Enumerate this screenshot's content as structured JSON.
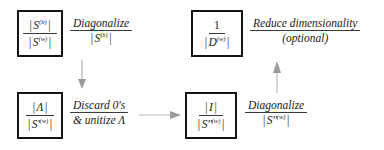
{
  "diagram": {
    "colors": {
      "box_border": "#141414",
      "text": "#1b1b1b",
      "rule": "#3a3a3a",
      "arrow": "#a8a8a8",
      "background": "#ffffff"
    },
    "nodes": [
      {
        "id": "node-sb-sw",
        "numerator": "| S (b) |",
        "num_symbol": "S",
        "num_sup": "(b)",
        "den_symbol": "S",
        "den_sup": "(w)",
        "denominator": "| S (w) |"
      },
      {
        "id": "node-one-dw",
        "numerator": "1",
        "num_symbol": "1",
        "num_sup": "",
        "den_symbol": "D",
        "den_sup": "(w)",
        "denominator": "| D (w) |"
      },
      {
        "id": "node-lambda-sw",
        "numerator": "| Λ |",
        "num_symbol": "Λ",
        "num_sup": "",
        "den_symbol": "S'",
        "den_sup": "(w)",
        "denominator": "| S' (w) |"
      },
      {
        "id": "node-i-sw",
        "numerator": "| I |",
        "num_symbol": "I",
        "num_sup": "",
        "den_symbol": "S''",
        "den_sup": "(w)",
        "denominator": "| S'' (w) |"
      }
    ],
    "edge_labels": [
      {
        "id": "label-diagonalize-sb",
        "line1": "Diagonalize",
        "line2_symbol": "S",
        "line2_sup": "(b)",
        "line2": "| S (b) |"
      },
      {
        "id": "label-reduce-dimensionality",
        "line1": "Reduce dimensionality",
        "line2": "(optional)"
      },
      {
        "id": "label-discard-unitize",
        "line1": "Discard 0's",
        "line2": "& unitize Λ"
      },
      {
        "id": "label-diagonalize-sw2",
        "line1": "Diagonalize",
        "line2_symbol": "S''",
        "line2_sup": "(w)",
        "line2": "| S'' (w) |"
      }
    ],
    "arrows": [
      {
        "id": "arrow-down-left",
        "direction": "down"
      },
      {
        "id": "arrow-right-bottom",
        "direction": "right"
      },
      {
        "id": "arrow-up-right",
        "direction": "up"
      }
    ]
  }
}
